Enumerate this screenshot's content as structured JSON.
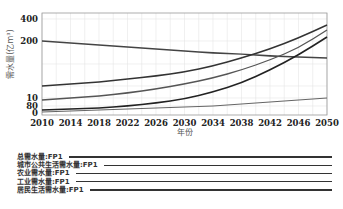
{
  "chart_data": {
    "type": "line",
    "title": "",
    "xlabel": "年份",
    "ylabel": "需水量(亿m³)",
    "x": [
      2010,
      2014,
      2018,
      2022,
      2026,
      2030,
      2034,
      2038,
      2042,
      2046,
      2050
    ],
    "x_ticks": [
      "2010",
      "2014",
      "2018",
      "2022",
      "2026",
      "2030",
      "2034",
      "2038",
      "2042",
      "2046",
      "2050"
    ],
    "y_ticks": [
      "0",
      "80",
      "10",
      "200",
      "400"
    ],
    "y_tick_positions_px": [
      113,
      106,
      98,
      41,
      19
    ],
    "grid": true,
    "legend_position": "below",
    "series": [
      {
        "name": "总需水量:FP1",
        "values_px": [
          41,
          43,
          45,
          47,
          49,
          51,
          53,
          54,
          56,
          57,
          58
        ]
      },
      {
        "name": "城市公共生活需水量:FP1",
        "values_px": [
          86,
          84,
          82,
          79,
          76,
          72,
          66,
          58,
          49,
          38,
          25
        ]
      },
      {
        "name": "农业需水量:FP1",
        "values_px": [
          100,
          98,
          96,
          93,
          89,
          84,
          78,
          70,
          60,
          48,
          30
        ]
      },
      {
        "name": "工业需水量:FP1",
        "values_px": [
          110,
          109,
          108,
          106,
          103,
          99,
          92,
          83,
          70,
          55,
          37
        ]
      },
      {
        "name": "居民生活需水量:FP1",
        "values_px": [
          112,
          111,
          110,
          109,
          108,
          107,
          106,
          104,
          102,
          100,
          98
        ]
      }
    ]
  },
  "legend": [
    {
      "label": "总需水量:FP1"
    },
    {
      "label": "城市公共生活需水量:FP1"
    },
    {
      "label": "农业需水量:FP1"
    },
    {
      "label": "工业需水量:FP1"
    },
    {
      "label": "居民生活需水量:FP1"
    }
  ],
  "colors": {
    "line": "#333333",
    "grid": "#e6e6e6",
    "axis": "#999999"
  }
}
